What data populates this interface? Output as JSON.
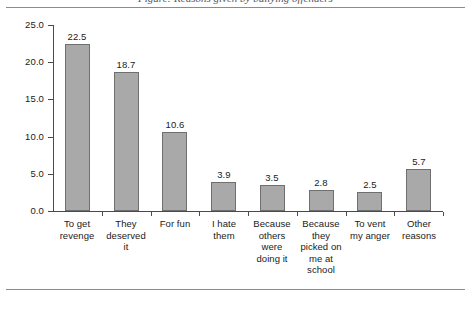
{
  "figure": {
    "caption": "Figure: Reasons given by bullying offenders",
    "background_color": "#ffffff",
    "rule_color": "#8b8b8b"
  },
  "chart_data": {
    "type": "bar",
    "title": "",
    "xlabel": "",
    "ylabel": "",
    "ylim": [
      0.0,
      25.0
    ],
    "ytick_labels": [
      "0.0",
      "5.0",
      "10.0",
      "15.0",
      "20.0",
      "25.0"
    ],
    "ytick_values": [
      0.0,
      5.0,
      10.0,
      15.0,
      20.0,
      25.0
    ],
    "grid": false,
    "legend": "none",
    "bar_color": "#a9a9a9",
    "bar_edge_color": "#6f6f6f",
    "axis_color": "#4a4a4a",
    "categories": [
      "To get revenge",
      "They deserved it",
      "For fun",
      "I hate them",
      "Because others were doing it",
      "Because they picked on me at school",
      "To vent my anger",
      "Other reasons"
    ],
    "category_lines": [
      [
        "To get",
        "revenge"
      ],
      [
        "They",
        "deserved",
        "it"
      ],
      [
        "For fun"
      ],
      [
        "I hate",
        "them"
      ],
      [
        "Because",
        "others",
        "were",
        "doing it"
      ],
      [
        "Because",
        "they",
        "picked on",
        "me at",
        "school"
      ],
      [
        "To vent",
        "my anger"
      ],
      [
        "Other",
        "reasons"
      ]
    ],
    "values": [
      22.5,
      18.7,
      10.6,
      3.9,
      3.5,
      2.8,
      2.5,
      5.7
    ],
    "value_labels": [
      "22.5",
      "18.7",
      "10.6",
      "3.9",
      "3.5",
      "2.8",
      "2.5",
      "5.7"
    ]
  }
}
